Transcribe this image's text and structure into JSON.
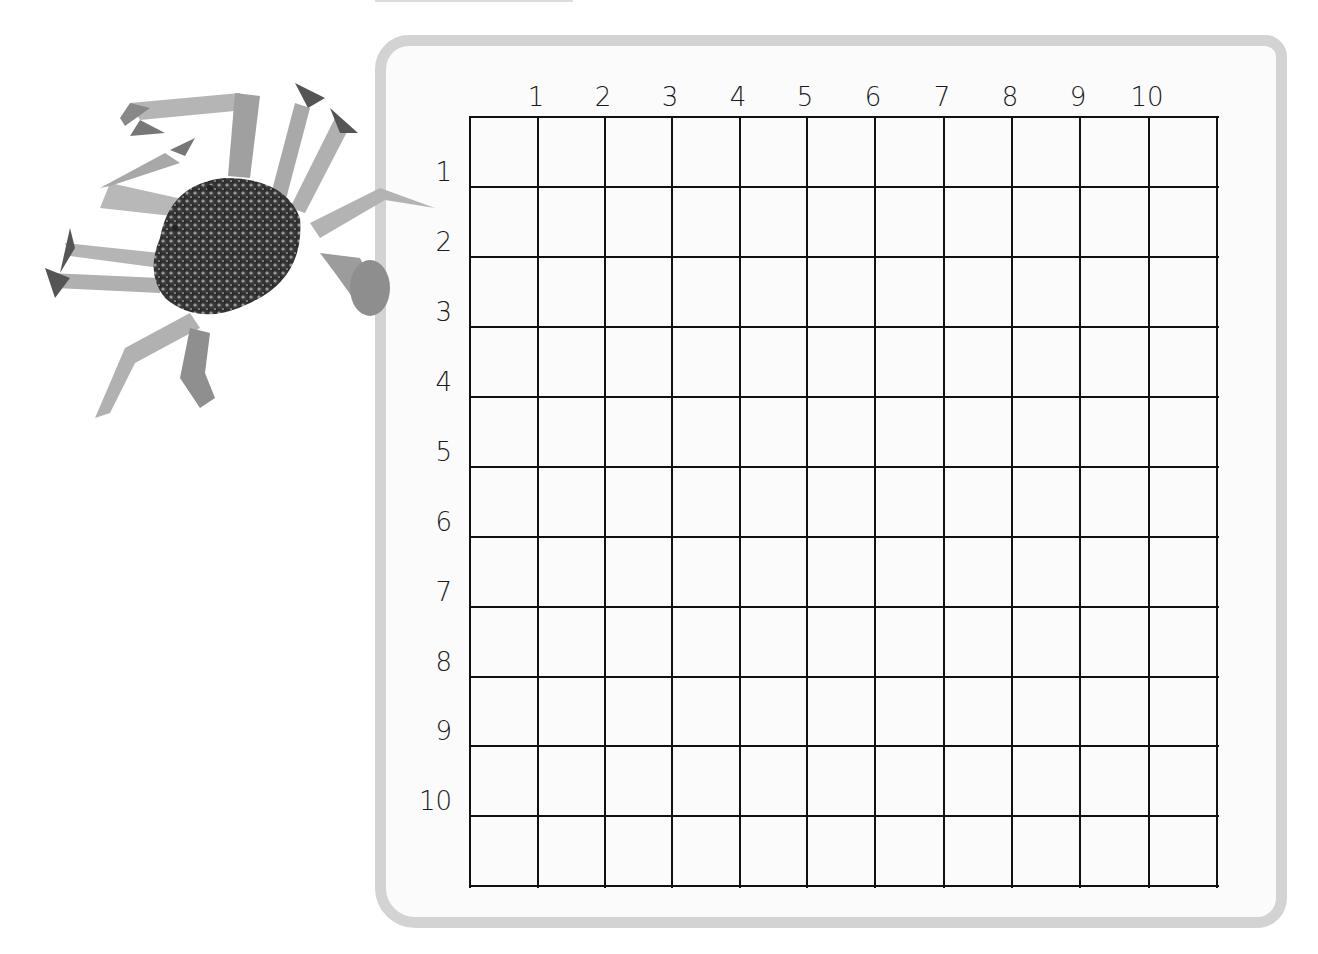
{
  "worksheet": {
    "type": "coordinate grid",
    "columns": [
      "1",
      "2",
      "3",
      "4",
      "5",
      "6",
      "7",
      "8",
      "9",
      "10"
    ],
    "rows": [
      "1",
      "2",
      "3",
      "4",
      "5",
      "6",
      "7",
      "8",
      "9",
      "10"
    ],
    "grid_size": {
      "cols": 11,
      "rows": 11
    },
    "colors": {
      "frame": "#d3d3d3",
      "grid_line": "#111111",
      "background": "#fbfbfb"
    }
  },
  "illustration": {
    "subject": "blue swimmer crab (grayscale)"
  }
}
